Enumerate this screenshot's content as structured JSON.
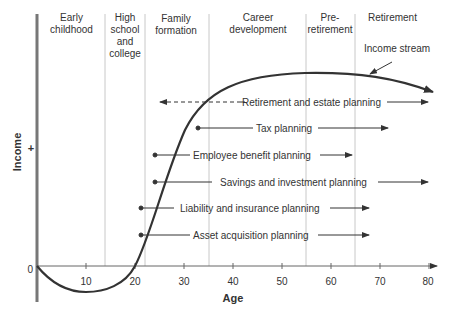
{
  "stages": [
    {
      "label_lines": [
        "Early",
        "childhood"
      ],
      "from_age": 0,
      "to_age": 14
    },
    {
      "label_lines": [
        "High",
        "school",
        "and",
        "college"
      ],
      "from_age": 14,
      "to_age": 22
    },
    {
      "label_lines": [
        "Family",
        "formation"
      ],
      "from_age": 22,
      "to_age": 35.5
    },
    {
      "label_lines": [
        "Career",
        "development"
      ],
      "from_age": 35.5,
      "to_age": 55
    },
    {
      "label_lines": [
        "Pre-",
        "retirement"
      ],
      "from_age": 55,
      "to_age": 65
    },
    {
      "label_lines": [
        "Retirement"
      ],
      "from_age": 65,
      "to_age": 82
    }
  ],
  "curve_label": "Income stream",
  "y_axis": {
    "label": "Income",
    "plus": "+",
    "zero": "0"
  },
  "x_axis": {
    "label": "Age",
    "ticks": [
      "10",
      "20",
      "30",
      "40",
      "50",
      "60",
      "70",
      "80"
    ]
  },
  "planning": [
    {
      "label": "Retirement and estate planning",
      "start_age": 25,
      "end_age": 80,
      "dashed_start": true
    },
    {
      "label": "Tax planning",
      "start_age": 33,
      "end_age": 72
    },
    {
      "label": "Employee benefit planning",
      "start_age": 24,
      "end_age": 65
    },
    {
      "label": "Savings and investment planning",
      "start_age": 24,
      "end_age": 80
    },
    {
      "label": "Liability and insurance planning",
      "start_age": 21,
      "end_age": 68
    },
    {
      "label": "Asset acquisition planning",
      "start_age": 21,
      "end_age": 68
    }
  ],
  "colors": {
    "line": "#333333",
    "divider": "#c8c8c8",
    "axis": "#666666"
  }
}
